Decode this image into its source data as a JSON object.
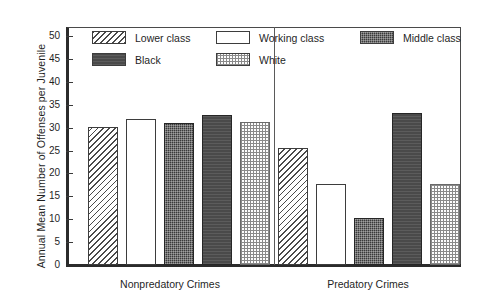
{
  "chart_data": {
    "type": "bar",
    "title": "",
    "subtitle": "",
    "xlabel": "",
    "ylabel": "Annual Mean Number of Offenses per Juvenile",
    "categories": [
      "Nonpredatory Crimes",
      "Predatory Crimes"
    ],
    "series": [
      {
        "name": "Lower class",
        "pattern": "diagonal-hatch",
        "values": [
          30.1,
          25.6
        ]
      },
      {
        "name": "Working class",
        "pattern": "open-white",
        "values": [
          31.8,
          17.6
        ]
      },
      {
        "name": "Middle class",
        "pattern": "dark-speckle",
        "values": [
          31.0,
          10.3
        ]
      },
      {
        "name": "Black",
        "pattern": "dark-solid",
        "values": [
          32.7,
          33.3
        ]
      },
      {
        "name": "White",
        "pattern": "light-dots",
        "values": [
          31.2,
          17.7
        ]
      }
    ],
    "ylim": [
      0,
      52
    ],
    "yticks": [
      0,
      5,
      10,
      15,
      20,
      25,
      30,
      35,
      40,
      45,
      50
    ],
    "ytick_labels": [
      "0",
      "5",
      "10",
      "15",
      "20",
      "25",
      "30",
      "35",
      "40",
      "45",
      "50"
    ],
    "grid": false,
    "legend_position": "inside-top-left",
    "group_divider": true,
    "colors": {
      "axis": "#2b2b2b",
      "frame": "#4a4a4a",
      "text": "#1f1f1f",
      "hatch": "#4a4a4a",
      "dark_fill": "#3a3a3a",
      "solid_fill": "#4a4a4a",
      "dot_fill": "#8a8a8a",
      "background": "#ffffff"
    }
  },
  "legend": {
    "items": [
      {
        "label": "Lower class",
        "pattern": "diagonal-hatch"
      },
      {
        "label": "Working class",
        "pattern": "open-white"
      },
      {
        "label": "Middle class",
        "pattern": "dark-speckle"
      },
      {
        "label": "Black",
        "pattern": "dark-solid"
      },
      {
        "label": "White",
        "pattern": "light-dots"
      }
    ]
  }
}
